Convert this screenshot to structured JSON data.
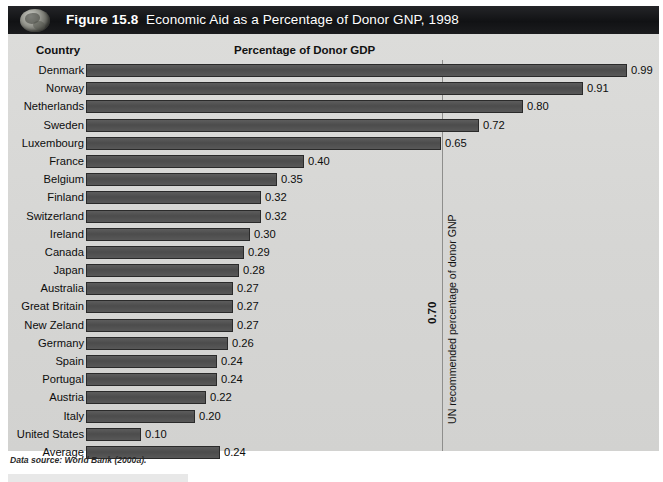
{
  "figure": {
    "number_label": "Figure 15.8",
    "title": "Economic Aid as a Percentage of Donor GNP, 1998",
    "icon": "globe-icon",
    "source_note": "Data source: World Bank (2000a).",
    "band_color": "#111214",
    "panel_color": "#d6d6d4",
    "bar_color": "#4c4c4c"
  },
  "headers": {
    "country": "Country",
    "percentage": "Percentage of Donor GDP"
  },
  "reference": {
    "value_label": "0.70",
    "caption": "UN recommended percentage of donor GNP",
    "value": 0.7
  },
  "chart_data": {
    "type": "bar",
    "orientation": "horizontal",
    "title": "Economic Aid as a Percentage of Donor GNP, 1998",
    "xlabel": "Percentage of Donor GDP",
    "ylabel": "Country",
    "xlim": [
      0,
      1.02
    ],
    "grid": false,
    "legend": null,
    "annotations": [
      {
        "type": "vline",
        "value": 0.7,
        "label": "0.70",
        "caption": "UN recommended percentage of donor GNP"
      }
    ],
    "categories": [
      "Denmark",
      "Norway",
      "Netherlands",
      "Sweden",
      "Luxembourg",
      "France",
      "Belgium",
      "Finland",
      "Switzerland",
      "Ireland",
      "Canada",
      "Japan",
      "Australia",
      "Great Britain",
      "New Zeland",
      "Germany",
      "Spain",
      "Portugal",
      "Austria",
      "Italy",
      "United States",
      "Average"
    ],
    "values": [
      0.99,
      0.91,
      0.8,
      0.72,
      0.65,
      0.4,
      0.35,
      0.32,
      0.32,
      0.3,
      0.29,
      0.28,
      0.27,
      0.27,
      0.27,
      0.26,
      0.24,
      0.24,
      0.22,
      0.2,
      0.1,
      0.24
    ],
    "value_labels": [
      "0.99",
      "0.91",
      "0.80",
      "0.72",
      "0.65",
      "0.40",
      "0.35",
      "0.32",
      "0.32",
      "0.30",
      "0.29",
      "0.28",
      "0.27",
      "0.27",
      "0.27",
      "0.26",
      "0.24",
      "0.24",
      "0.22",
      "0.20",
      "0.10",
      "0.24"
    ],
    "drawn_lengths": [
      0.99,
      0.91,
      0.8,
      0.72,
      0.65,
      0.4,
      0.35,
      0.32,
      0.32,
      0.3,
      0.29,
      0.28,
      0.27,
      0.27,
      0.27,
      0.26,
      0.24,
      0.24,
      0.22,
      0.2,
      0.1,
      0.245
    ]
  }
}
